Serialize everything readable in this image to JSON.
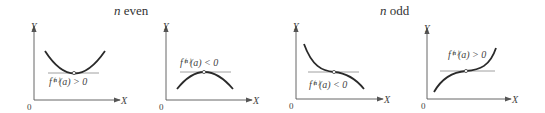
{
  "groups": [
    {
      "label_var": "n",
      "label_text": " even"
    },
    {
      "label_var": "n",
      "label_text": " odd"
    }
  ],
  "panels": [
    {
      "condition": "f⁽ⁿ⁾(a) > 0",
      "x_label": "X",
      "y_label": "Y",
      "origin": "0",
      "shape": "minimum"
    },
    {
      "condition": "f⁽ⁿ⁾(a) < 0",
      "x_label": "X",
      "y_label": "Y",
      "origin": "0",
      "shape": "maximum"
    },
    {
      "condition": "f⁽ⁿ⁾(a) < 0",
      "x_label": "X",
      "y_label": "Y",
      "origin": "0",
      "shape": "decreasing-inflection"
    },
    {
      "condition": "f⁽ⁿ⁾(a) > 0",
      "x_label": "X",
      "y_label": "Y",
      "origin": "0",
      "shape": "increasing-inflection"
    }
  ]
}
